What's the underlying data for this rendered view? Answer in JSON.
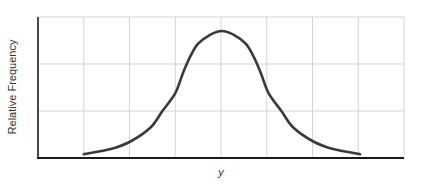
{
  "chart_data": {
    "type": "line",
    "title": "",
    "xlabel": "y",
    "ylabel": "Relative Frequency",
    "x_tick_labels": [],
    "y_tick_labels": [],
    "grid": true,
    "grid_columns": 8,
    "grid_rows": 3,
    "legend": null,
    "series": [
      {
        "name": "distribution",
        "color": "#3a3a3a",
        "x": [
          0.0,
          0.59,
          1.02,
          1.46,
          1.72,
          2.0,
          2.17,
          2.33,
          2.5,
          2.76,
          3.02,
          3.28,
          3.54,
          3.71,
          3.87,
          4.04,
          4.32,
          4.58,
          5.02,
          5.45,
          6.04
        ],
        "values": [
          0.03,
          0.07,
          0.13,
          0.24,
          0.37,
          0.51,
          0.67,
          0.8,
          0.9,
          0.97,
          1.0,
          0.97,
          0.9,
          0.8,
          0.67,
          0.51,
          0.37,
          0.24,
          0.13,
          0.07,
          0.03
        ]
      }
    ],
    "xlim": [
      -1.0,
      7.0
    ],
    "ylim": [
      0,
      1.0
    ]
  },
  "labels": {
    "y_axis": "Relative Frequency",
    "x_axis": "y"
  },
  "colors": {
    "curve": "#3a3a3a",
    "axis": "#1a1a1a",
    "grid": "#d4d4d4"
  },
  "layout": {
    "plot_left": 38,
    "plot_right": 404,
    "plot_top": 17,
    "plot_bottom": 158
  }
}
